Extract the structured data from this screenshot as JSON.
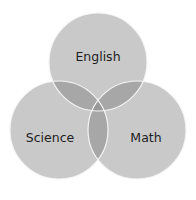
{
  "diagram": {
    "type": "venn",
    "sets": [
      {
        "id": "english",
        "label": "English",
        "cx": 98,
        "cy": 62,
        "r": 49,
        "label_x": 98,
        "label_y": 56
      },
      {
        "id": "science",
        "label": "Science",
        "cx": 59,
        "cy": 130,
        "r": 49,
        "label_x": 50,
        "label_y": 137
      },
      {
        "id": "math",
        "label": "Math",
        "cx": 137,
        "cy": 130,
        "r": 49,
        "label_x": 146,
        "label_y": 137
      }
    ],
    "colors": {
      "circle_fill": "#c9c9c9",
      "pair_overlap_fill": "#a7a7a7",
      "triple_overlap_fill": "#989898",
      "outline": "#f4f4f4",
      "text": "#1e1e1e",
      "background": "#ffffff"
    }
  }
}
